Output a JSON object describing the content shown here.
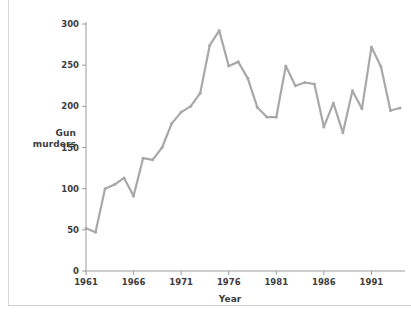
{
  "chart_data": {
    "type": "line",
    "title": "",
    "xlabel": "Year",
    "ylabel": "Gun murders",
    "ylabel_lines": [
      "Gun",
      "murders"
    ],
    "xlim": [
      1961,
      1994
    ],
    "ylim": [
      0,
      300
    ],
    "ytick_values": [
      0,
      50,
      100,
      150,
      200,
      250,
      300
    ],
    "ytick_labels": [
      "0",
      "50",
      "100",
      "150",
      "200",
      "250",
      "300"
    ],
    "xtick_values": [
      1961,
      1966,
      1971,
      1976,
      1981,
      1986,
      1991
    ],
    "xtick_labels": [
      "1961",
      "1966",
      "1971",
      "1976",
      "1981",
      "1986",
      "1991"
    ],
    "grid": false,
    "legend": "none",
    "line_color": "#a8a8a8",
    "axis_color": "#9b9b9b",
    "text_color": "#3d3d3d",
    "x": [
      1961,
      1962,
      1963,
      1964,
      1965,
      1966,
      1967,
      1968,
      1969,
      1970,
      1971,
      1972,
      1973,
      1974,
      1975,
      1976,
      1977,
      1978,
      1979,
      1980,
      1981,
      1982,
      1983,
      1984,
      1985,
      1986,
      1987,
      1988,
      1989,
      1990,
      1991,
      1992,
      1993,
      1994
    ],
    "values": [
      52,
      47,
      100,
      105,
      113,
      91,
      137,
      135,
      150,
      179,
      193,
      200,
      216,
      274,
      292,
      249,
      254,
      234,
      199,
      187,
      187,
      249,
      225,
      229,
      227,
      175,
      204,
      168,
      219,
      197,
      272,
      248,
      195,
      198
    ],
    "series": [
      {
        "name": "Gun murders",
        "values": [
          52,
          47,
          100,
          105,
          113,
          91,
          137,
          135,
          150,
          179,
          193,
          200,
          216,
          274,
          292,
          249,
          254,
          234,
          199,
          187,
          187,
          249,
          225,
          229,
          227,
          175,
          204,
          168,
          219,
          197,
          272,
          248,
          195,
          198
        ]
      }
    ]
  }
}
